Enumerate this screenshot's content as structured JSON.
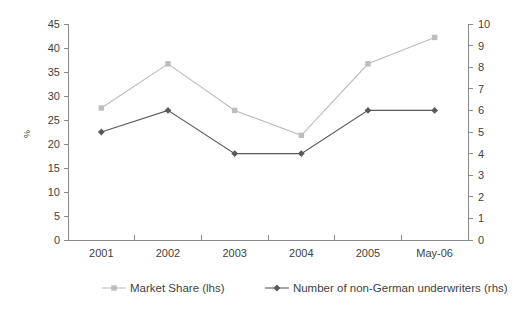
{
  "chart_data": {
    "type": "line",
    "title": "",
    "subtitle": "",
    "xlabel": "",
    "ylabel": "%",
    "ylabel_right": "",
    "categories": [
      "2001",
      "2002",
      "2003",
      "2004",
      "2005",
      "May-06"
    ],
    "left_axis": {
      "label": "%",
      "min": 0,
      "max": 45,
      "step": 5,
      "ticks": [
        "0",
        "5",
        "10",
        "15",
        "20",
        "25",
        "30",
        "35",
        "40",
        "45"
      ]
    },
    "right_axis": {
      "label": "",
      "min": 0,
      "max": 10,
      "step": 1,
      "ticks": [
        "0",
        "1",
        "2",
        "3",
        "4",
        "5",
        "6",
        "7",
        "8",
        "9",
        "10"
      ]
    },
    "grid": false,
    "legend_position": "bottom",
    "series": [
      {
        "name": "Market Share (lhs)",
        "axis": "left",
        "marker": "square",
        "color": "#bdbdbd",
        "values": [
          27.5,
          36.7,
          27.0,
          21.8,
          36.7,
          42.2
        ]
      },
      {
        "name": "Number of non-German underwriters (rhs)",
        "axis": "right",
        "marker": "diamond",
        "color": "#5a5a5a",
        "values": [
          5.0,
          6.0,
          4.0,
          4.0,
          6.0,
          6.0
        ]
      }
    ],
    "legend": [
      {
        "label": "Market Share (lhs)",
        "marker": "square",
        "color": "#bdbdbd"
      },
      {
        "label": "Number of non-German underwriters (rhs)",
        "marker": "diamond",
        "color": "#5a5a5a"
      }
    ]
  }
}
